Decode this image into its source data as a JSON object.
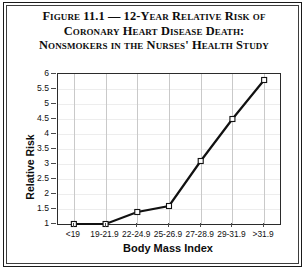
{
  "figure": {
    "title_lines": [
      "Figure 11.1 — 12-Year Relative Risk of",
      "Coronary Heart Disease Death:",
      "Nonsmokers in the Nurses' Health Study"
    ]
  },
  "chart_data": {
    "type": "line",
    "title": "Figure 11.1 — 12-Year Relative Risk of Coronary Heart Disease Death: Nonsmokers in the Nurses' Health Study",
    "xlabel": "Body Mass Index",
    "ylabel": "Relative Risk",
    "categories": [
      "<19",
      "19-21.9",
      "22-24.9",
      "25-26.9",
      "27-28.9",
      "29-31.9",
      ">31.9"
    ],
    "values": [
      1,
      1,
      1.4,
      1.6,
      3.1,
      4.5,
      5.8
    ],
    "ylim": [
      1,
      6
    ],
    "yticks": [
      1,
      1.5,
      2,
      2.5,
      3,
      3.5,
      4,
      4.5,
      5,
      5.5,
      6
    ],
    "ytick_labels": [
      "1",
      "1.5",
      "2",
      "2.5",
      "3",
      "3.5",
      "4",
      "4.5",
      "5",
      "5.5",
      "6"
    ],
    "grid": "both",
    "legend": "none",
    "marker": "open-square",
    "line_color": "#111111",
    "marker_fill": "#ffffff",
    "gridline_color": "#c9c9c9",
    "axis_color": "#2b2b2b"
  }
}
